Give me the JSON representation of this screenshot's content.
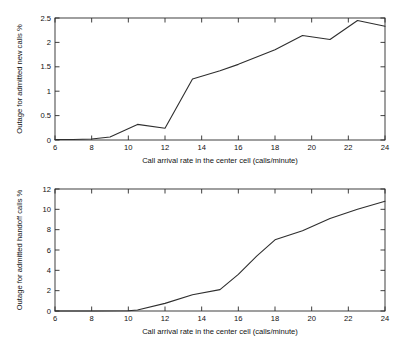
{
  "figure": {
    "background": "#ffffff",
    "line_color": "#2e2e2e",
    "axis_color": "#2b2b2b"
  },
  "chart_data": [
    {
      "type": "line",
      "id": "new-calls-outage",
      "title": "",
      "xlabel": "Call arrival rate in the center cell (calls/minute)",
      "ylabel": "Outage for admitted new calls %",
      "xlim": [
        6,
        24
      ],
      "ylim": [
        0,
        2.5
      ],
      "xticks": [
        6,
        8,
        10,
        12,
        14,
        16,
        18,
        20,
        22,
        24
      ],
      "xtick_labels": [
        "6",
        "8",
        "10",
        "12",
        "14",
        "16",
        "18",
        "20",
        "22",
        "24"
      ],
      "yticks": [
        0,
        0.5,
        1,
        1.5,
        2,
        2.5
      ],
      "ytick_labels": [
        "0",
        "0.5",
        "1",
        "1.5",
        "2",
        "2.5"
      ],
      "grid": false,
      "legend": null,
      "x": [
        6,
        7,
        8,
        9,
        10.5,
        12,
        13.5,
        15,
        16,
        18,
        19.5,
        21,
        22.5,
        24
      ],
      "values": [
        0.01,
        0.01,
        0.02,
        0.06,
        0.32,
        0.24,
        1.25,
        1.42,
        1.55,
        1.85,
        2.14,
        2.06,
        2.45,
        2.33
      ]
    },
    {
      "type": "line",
      "id": "handoff-calls-outage",
      "title": "",
      "xlabel": "Call arrival rate in the center cell (calls/minute)",
      "ylabel": "Outage for admitted handoff calls %",
      "xlim": [
        6,
        24
      ],
      "ylim": [
        0,
        12
      ],
      "xticks": [
        6,
        8,
        10,
        12,
        14,
        16,
        18,
        20,
        22,
        24
      ],
      "xtick_labels": [
        "6",
        "8",
        "10",
        "12",
        "14",
        "16",
        "18",
        "20",
        "22",
        "24"
      ],
      "yticks": [
        0,
        2,
        4,
        6,
        8,
        10,
        12
      ],
      "ytick_labels": [
        "0",
        "2",
        "4",
        "6",
        "8",
        "10",
        "12"
      ],
      "grid": false,
      "legend": null,
      "x": [
        6,
        8,
        10,
        10.5,
        12,
        13.5,
        15,
        16,
        17,
        18,
        19.5,
        21,
        22.5,
        24
      ],
      "values": [
        0.0,
        0.0,
        0.03,
        0.1,
        0.75,
        1.6,
        2.1,
        3.6,
        5.4,
        7.0,
        7.9,
        9.1,
        10.0,
        10.8
      ]
    }
  ]
}
